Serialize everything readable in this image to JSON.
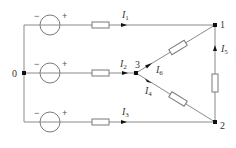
{
  "diagram": {
    "type": "circuit",
    "colors": {
      "wire": "#8a8a8a",
      "node": "#111111",
      "text": "#333333"
    },
    "nodes": [
      {
        "id": "0",
        "label": "0"
      },
      {
        "id": "1",
        "label": "1"
      },
      {
        "id": "2",
        "label": "2"
      },
      {
        "id": "3",
        "label": "3"
      }
    ],
    "sources": [
      {
        "id": "top",
        "minus": "−",
        "plus": "+"
      },
      {
        "id": "middle",
        "minus": "−",
        "plus": "+"
      },
      {
        "id": "bottom",
        "minus": "−",
        "plus": "+"
      }
    ],
    "currents": [
      {
        "id": "I1",
        "base": "I",
        "sub": "1"
      },
      {
        "id": "I2",
        "base": "I",
        "sub": "2"
      },
      {
        "id": "I3",
        "base": "I",
        "sub": "3"
      },
      {
        "id": "I4",
        "base": "I",
        "sub": "4"
      },
      {
        "id": "I5",
        "base": "I",
        "sub": "5"
      },
      {
        "id": "I6",
        "base": "I",
        "sub": "6"
      }
    ]
  }
}
